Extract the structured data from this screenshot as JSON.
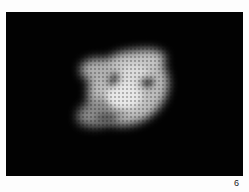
{
  "figure": {
    "panel_label": "6",
    "colors": {
      "background": "#020202",
      "page": "#fdfdfd",
      "blob": "#d8d8d8"
    }
  }
}
